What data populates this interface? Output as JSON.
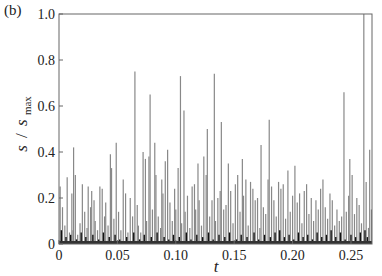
{
  "panel_label": "(b)",
  "chart_data": {
    "type": "bar",
    "title": "",
    "xlabel": "t",
    "ylabel": "s / s_max",
    "ylabel_parts": {
      "s": "s",
      "slash": "/",
      "smax": "s",
      "sub": "max"
    },
    "xlim": [
      0,
      0.268
    ],
    "ylim": [
      0,
      1.0
    ],
    "xticks": [
      0,
      0.05,
      0.1,
      0.15,
      0.2,
      0.25
    ],
    "xtick_labels": [
      "0",
      "0.05",
      "0.10",
      "0.15",
      "0.20",
      "0.25"
    ],
    "yticks": [
      0,
      0.2,
      0.4,
      0.6,
      0.8,
      1.0
    ],
    "ytick_labels": [
      "0",
      "0.2",
      "0.4",
      "0.6",
      "0.8",
      "1.0"
    ],
    "grid": false,
    "legend": null,
    "series": [
      {
        "name": "avalanche size",
        "color": "#888888",
        "points": [
          [
            0.001,
            0.25
          ],
          [
            0.003,
            0.16
          ],
          [
            0.005,
            0.08
          ],
          [
            0.007,
            0.29
          ],
          [
            0.009,
            0.05
          ],
          [
            0.011,
            0.22
          ],
          [
            0.012,
            0.06
          ],
          [
            0.0125,
            0.42
          ],
          [
            0.014,
            0.3
          ],
          [
            0.016,
            0.04
          ],
          [
            0.018,
            0.09
          ],
          [
            0.02,
            0.26
          ],
          [
            0.022,
            0.14
          ],
          [
            0.024,
            0.07
          ],
          [
            0.025,
            0.25
          ],
          [
            0.027,
            0.16
          ],
          [
            0.028,
            0.23
          ],
          [
            0.03,
            0.19
          ],
          [
            0.031,
            0.1
          ],
          [
            0.033,
            0.06
          ],
          [
            0.035,
            0.25
          ],
          [
            0.037,
            0.24
          ],
          [
            0.039,
            0.12
          ],
          [
            0.04,
            0.18
          ],
          [
            0.042,
            0.08
          ],
          [
            0.044,
            0.39
          ],
          [
            0.045,
            0.33
          ],
          [
            0.047,
            0.11
          ],
          [
            0.049,
            0.44
          ],
          [
            0.051,
            0.14
          ],
          [
            0.053,
            0.06
          ],
          [
            0.055,
            0.28
          ],
          [
            0.057,
            0.22
          ],
          [
            0.059,
            0.05
          ],
          [
            0.061,
            0.2
          ],
          [
            0.063,
            0.12
          ],
          [
            0.065,
            0.75
          ],
          [
            0.067,
            0.17
          ],
          [
            0.068,
            0.08
          ],
          [
            0.07,
            0.05
          ],
          [
            0.072,
            0.4
          ],
          [
            0.074,
            0.37
          ],
          [
            0.075,
            0.1
          ],
          [
            0.077,
            0.38
          ],
          [
            0.078,
            0.65
          ],
          [
            0.08,
            0.15
          ],
          [
            0.082,
            0.44
          ],
          [
            0.083,
            0.3
          ],
          [
            0.085,
            0.12
          ],
          [
            0.087,
            0.07
          ],
          [
            0.088,
            0.28
          ],
          [
            0.089,
            0.22
          ],
          [
            0.091,
            0.36
          ],
          [
            0.093,
            0.41
          ],
          [
            0.095,
            0.18
          ],
          [
            0.097,
            0.1
          ],
          [
            0.099,
            0.24
          ],
          [
            0.1,
            0.15
          ],
          [
            0.102,
            0.33
          ],
          [
            0.104,
            0.73
          ],
          [
            0.105,
            0.09
          ],
          [
            0.107,
            0.58
          ],
          [
            0.108,
            0.14
          ],
          [
            0.11,
            0.21
          ],
          [
            0.112,
            0.07
          ],
          [
            0.114,
            0.25
          ],
          [
            0.116,
            0.26
          ],
          [
            0.117,
            0.15
          ],
          [
            0.119,
            0.35
          ],
          [
            0.12,
            0.19
          ],
          [
            0.122,
            0.08
          ],
          [
            0.124,
            0.38
          ],
          [
            0.126,
            0.3
          ],
          [
            0.127,
            0.5
          ],
          [
            0.129,
            0.12
          ],
          [
            0.131,
            0.19
          ],
          [
            0.133,
            0.74
          ],
          [
            0.134,
            0.1
          ],
          [
            0.136,
            0.2
          ],
          [
            0.138,
            0.23
          ],
          [
            0.139,
            0.53
          ],
          [
            0.141,
            0.15
          ],
          [
            0.143,
            0.17
          ],
          [
            0.145,
            0.35
          ],
          [
            0.147,
            0.23
          ],
          [
            0.149,
            0.09
          ],
          [
            0.151,
            0.26
          ],
          [
            0.153,
            0.3
          ],
          [
            0.155,
            0.14
          ],
          [
            0.157,
            0.37
          ],
          [
            0.158,
            0.21
          ],
          [
            0.16,
            0.28
          ],
          [
            0.162,
            0.08
          ],
          [
            0.164,
            0.27
          ],
          [
            0.166,
            0.24
          ],
          [
            0.168,
            0.19
          ],
          [
            0.17,
            0.2
          ],
          [
            0.172,
            0.07
          ],
          [
            0.173,
            0.43
          ],
          [
            0.175,
            0.16
          ],
          [
            0.177,
            0.13
          ],
          [
            0.179,
            0.28
          ],
          [
            0.18,
            0.54
          ],
          [
            0.182,
            0.25
          ],
          [
            0.184,
            0.19
          ],
          [
            0.186,
            0.12
          ],
          [
            0.188,
            0.27
          ],
          [
            0.19,
            0.24
          ],
          [
            0.192,
            0.26
          ],
          [
            0.194,
            0.11
          ],
          [
            0.196,
            0.32
          ],
          [
            0.198,
            0.14
          ],
          [
            0.2,
            0.21
          ],
          [
            0.202,
            0.34
          ],
          [
            0.204,
            0.18
          ],
          [
            0.206,
            0.22
          ],
          [
            0.208,
            0.09
          ],
          [
            0.21,
            0.23
          ],
          [
            0.212,
            0.26
          ],
          [
            0.214,
            0.13
          ],
          [
            0.216,
            0.2
          ],
          [
            0.218,
            0.1
          ],
          [
            0.22,
            0.19
          ],
          [
            0.222,
            0.15
          ],
          [
            0.224,
            0.24
          ],
          [
            0.226,
            0.28
          ],
          [
            0.228,
            0.16
          ],
          [
            0.23,
            0.11
          ],
          [
            0.232,
            0.22
          ],
          [
            0.234,
            0.19
          ],
          [
            0.236,
            0.08
          ],
          [
            0.238,
            0.15
          ],
          [
            0.24,
            0.1
          ],
          [
            0.242,
            0.12
          ],
          [
            0.244,
            0.66
          ],
          [
            0.246,
            0.14
          ],
          [
            0.248,
            0.21
          ],
          [
            0.249,
            0.37
          ],
          [
            0.251,
            0.3
          ],
          [
            0.253,
            0.13
          ],
          [
            0.255,
            0.2
          ],
          [
            0.257,
            0.17
          ],
          [
            0.259,
            0.09
          ],
          [
            0.261,
            1.0
          ],
          [
            0.263,
            0.27
          ],
          [
            0.265,
            0.07
          ],
          [
            0.266,
            0.41
          ],
          [
            0.2675,
            0.15
          ]
        ]
      },
      {
        "name": "small background events",
        "color": "#111111",
        "points": [
          [
            0.002,
            0.06
          ],
          [
            0.006,
            0.03
          ],
          [
            0.01,
            0.04
          ],
          [
            0.015,
            0.02
          ],
          [
            0.019,
            0.05
          ],
          [
            0.023,
            0.03
          ],
          [
            0.029,
            0.04
          ],
          [
            0.034,
            0.02
          ],
          [
            0.038,
            0.05
          ],
          [
            0.043,
            0.03
          ],
          [
            0.048,
            0.04
          ],
          [
            0.052,
            0.02
          ],
          [
            0.058,
            0.03
          ],
          [
            0.064,
            0.05
          ],
          [
            0.069,
            0.02
          ],
          [
            0.073,
            0.04
          ],
          [
            0.079,
            0.03
          ],
          [
            0.084,
            0.05
          ],
          [
            0.09,
            0.03
          ],
          [
            0.094,
            0.02
          ],
          [
            0.098,
            0.04
          ],
          [
            0.103,
            0.03
          ],
          [
            0.109,
            0.05
          ],
          [
            0.113,
            0.02
          ],
          [
            0.118,
            0.04
          ],
          [
            0.123,
            0.03
          ],
          [
            0.128,
            0.05
          ],
          [
            0.132,
            0.02
          ],
          [
            0.137,
            0.04
          ],
          [
            0.142,
            0.03
          ],
          [
            0.146,
            0.05
          ],
          [
            0.152,
            0.02
          ],
          [
            0.156,
            0.04
          ],
          [
            0.161,
            0.03
          ],
          [
            0.167,
            0.05
          ],
          [
            0.171,
            0.02
          ],
          [
            0.176,
            0.04
          ],
          [
            0.181,
            0.03
          ],
          [
            0.185,
            0.05
          ],
          [
            0.189,
            0.06
          ],
          [
            0.193,
            0.03
          ],
          [
            0.197,
            0.04
          ],
          [
            0.201,
            0.02
          ],
          [
            0.205,
            0.05
          ],
          [
            0.209,
            0.03
          ],
          [
            0.213,
            0.04
          ],
          [
            0.217,
            0.02
          ],
          [
            0.221,
            0.05
          ],
          [
            0.225,
            0.03
          ],
          [
            0.229,
            0.04
          ],
          [
            0.233,
            0.06
          ],
          [
            0.237,
            0.03
          ],
          [
            0.241,
            0.05
          ],
          [
            0.245,
            0.02
          ],
          [
            0.25,
            0.04
          ],
          [
            0.254,
            0.03
          ],
          [
            0.258,
            0.05
          ],
          [
            0.262,
            0.06
          ],
          [
            0.264,
            0.03
          ]
        ]
      }
    ]
  }
}
